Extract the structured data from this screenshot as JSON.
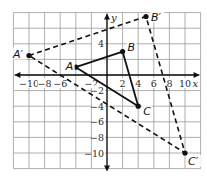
{
  "diagram": {
    "type": "coordinate-plane-dilation",
    "grid": {
      "xmin": -12,
      "xmax": 12,
      "ymin": -12,
      "ymax": 8,
      "step": 2,
      "grid_color": "#9a9a9a"
    },
    "axes": {
      "x_label": "x",
      "y_label": "y",
      "x_ticks": [
        {
          "value": -10,
          "label": "−10"
        },
        {
          "value": -8,
          "label": "−8"
        },
        {
          "value": -6,
          "label": "−6"
        },
        {
          "value": -2,
          "label": "−2"
        },
        {
          "value": 2,
          "label": "2"
        },
        {
          "value": 4,
          "label": "4"
        },
        {
          "value": 6,
          "label": "6"
        },
        {
          "value": 8,
          "label": "8"
        },
        {
          "value": 10,
          "label": "10"
        }
      ],
      "y_ticks": [
        {
          "value": 4,
          "label": "4"
        },
        {
          "value": -2,
          "label": "−2"
        },
        {
          "value": -4,
          "label": "−4"
        },
        {
          "value": -6,
          "label": "−6"
        },
        {
          "value": -8,
          "label": "−8"
        },
        {
          "value": -10,
          "label": "−10"
        }
      ]
    },
    "original_triangle": {
      "style": "solid",
      "color": "#111111",
      "vertices": [
        {
          "name": "A",
          "x": -4,
          "y": 1
        },
        {
          "name": "B",
          "x": 2,
          "y": 3
        },
        {
          "name": "C",
          "x": 4,
          "y": -4
        }
      ]
    },
    "image_triangle": {
      "style": "dashed",
      "color": "#111111",
      "vertices": [
        {
          "name": "A′",
          "x": -10,
          "y": 2.5
        },
        {
          "name": "B′",
          "x": 5,
          "y": 7.5
        },
        {
          "name": "C′",
          "x": 10,
          "y": -10
        }
      ]
    }
  }
}
